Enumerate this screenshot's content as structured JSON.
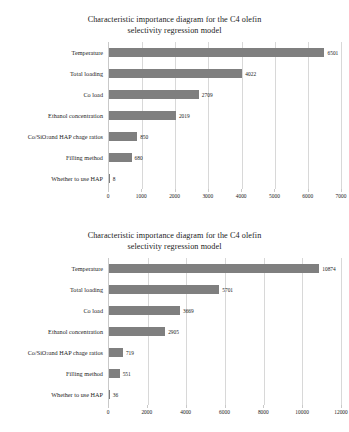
{
  "charts": [
    {
      "title_line1": "Characteristic importance diagram for the C4 olefin",
      "title_line2": "selectivity regression model",
      "chart_data": {
        "type": "bar",
        "orientation": "horizontal",
        "title": "Characteristic importance diagram for the C4 olefin selectivity regression model",
        "xlabel": "",
        "ylabel": "",
        "categories": [
          "Temperature",
          "Total loading",
          "Co load",
          "Ethanol concentration",
          "Co/SiO2 and HAP chage ratios",
          "Filling method",
          "Whether to use HAP"
        ],
        "values": [
          6501,
          4022,
          2709,
          2019,
          850,
          680,
          8
        ],
        "value_labels": [
          "6501",
          "4022",
          "2709",
          "2019",
          "850",
          "680",
          "8"
        ],
        "xlim": [
          0,
          7000
        ],
        "xticks": [
          0,
          1000,
          2000,
          3000,
          4000,
          5000,
          6000,
          7000
        ],
        "xtick_labels": [
          "0",
          "1000",
          "2000",
          "3000",
          "4000",
          "5000",
          "6000",
          "7000"
        ],
        "grid": true,
        "legend": false,
        "bar_color": "#7f7f7f"
      }
    },
    {
      "title_line1": "Characteristic importance diagram for the C4 olefin",
      "title_line2": "selectivity regression model",
      "chart_data": {
        "type": "bar",
        "orientation": "horizontal",
        "title": "Characteristic importance diagram for the C4 olefin selectivity regression model",
        "xlabel": "",
        "ylabel": "",
        "categories": [
          "Temperature",
          "Total loading",
          "Co load",
          "Ethanol concentration",
          "Co/SiO2 and HAP chage ratios",
          "Filling method",
          "Whether to use HAP"
        ],
        "values": [
          10874,
          5701,
          3669,
          2905,
          719,
          551,
          36
        ],
        "value_labels": [
          "10874",
          "5701",
          "3669",
          "2905",
          "719",
          "551",
          "36"
        ],
        "xlim": [
          0,
          12000
        ],
        "xticks": [
          0,
          2000,
          4000,
          6000,
          8000,
          10000,
          12000
        ],
        "xtick_labels": [
          "0",
          "2000",
          "4000",
          "6000",
          "8000",
          "10000",
          "12000"
        ],
        "grid": true,
        "legend": false,
        "bar_color": "#7f7f7f"
      }
    }
  ]
}
